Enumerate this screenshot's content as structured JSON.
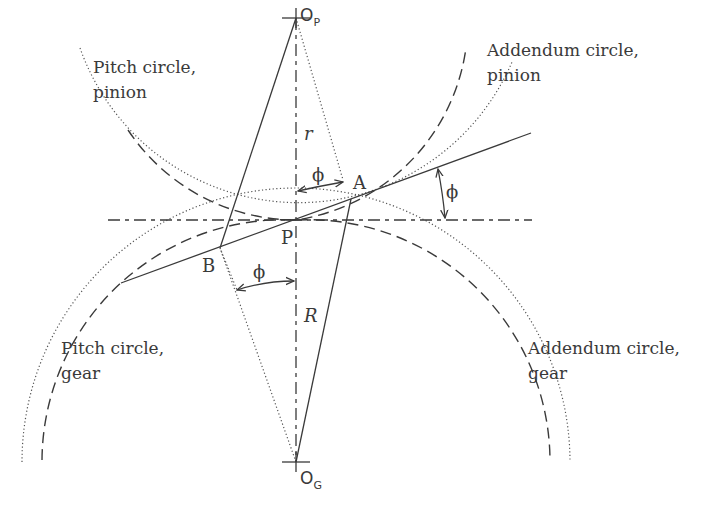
{
  "figure": {
    "points": {
      "pinion_center": "O",
      "pinion_center_sub": "P",
      "gear_center": "O",
      "gear_center_sub": "G",
      "pitch_point": "P",
      "contact_start": "A",
      "contact_end": "B"
    },
    "dimensions": {
      "pinion_radius": "r",
      "gear_radius": "R",
      "pressure_angle": "ϕ"
    },
    "labels": {
      "pitch_circle_pinion_line1": "Pitch circle,",
      "pitch_circle_pinion_line2": "pinion",
      "addendum_circle_pinion_line1": "Addendum circle,",
      "addendum_circle_pinion_line2": "pinion",
      "pitch_circle_gear_line1": "Pitch circle,",
      "pitch_circle_gear_line2": "gear",
      "addendum_circle_gear_line1": "Addendum circle,",
      "addendum_circle_gear_line2": "gear"
    },
    "colors": {
      "line": "#3a3a3a",
      "background": "#ffffff"
    }
  }
}
